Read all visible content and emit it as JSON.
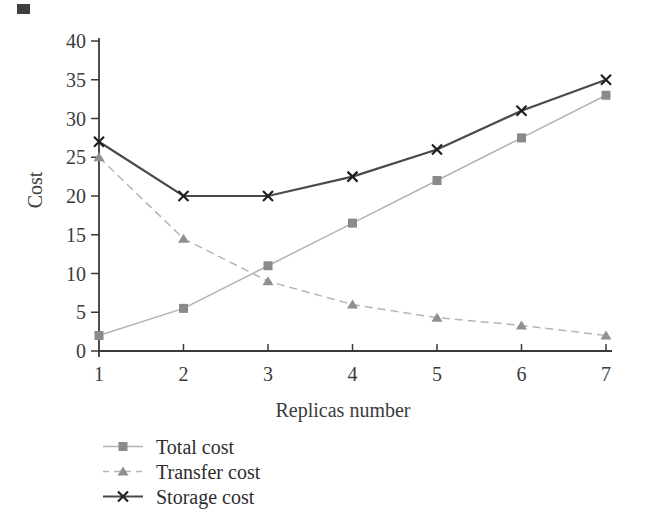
{
  "figure": {
    "background": "#ffffff",
    "artifact_color": "#3f3f3f"
  },
  "chart_data": {
    "type": "line",
    "title": "",
    "xlabel": "Replicas number",
    "ylabel": "Cost",
    "x": [
      1,
      2,
      3,
      4,
      5,
      6,
      7
    ],
    "xlim": [
      1,
      7
    ],
    "ylim": [
      0,
      40
    ],
    "yticks": [
      0,
      5,
      10,
      15,
      20,
      25,
      30,
      35,
      40
    ],
    "grid": false,
    "legend_position": "bottom-left",
    "axis_color": "#3a3a3a",
    "text_color": "#3b3b3b",
    "series": [
      {
        "name": "Total cost",
        "marker": "square",
        "line_style": "solid",
        "line_width": 1.5,
        "color": "#b3b3b3",
        "marker_color": "#8a8a8a",
        "values": [
          2,
          5.5,
          11,
          16.5,
          22,
          27.5,
          33
        ]
      },
      {
        "name": "Transfer cost",
        "marker": "triangle",
        "line_style": "dashed",
        "line_width": 1.5,
        "color": "#b5b5b5",
        "marker_color": "#8f8f8f",
        "values": [
          25,
          14.5,
          9,
          6,
          4.3,
          3.3,
          2
        ]
      },
      {
        "name": "Storage cost",
        "marker": "x",
        "line_style": "solid",
        "line_width": 2.2,
        "color": "#4a4a4a",
        "marker_color": "#1f1f1f",
        "values": [
          27,
          20,
          20,
          22.5,
          26,
          31,
          35
        ]
      }
    ]
  }
}
